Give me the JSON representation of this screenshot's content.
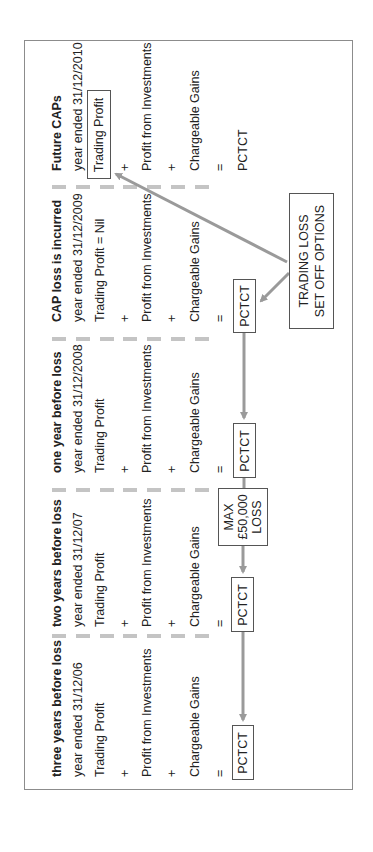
{
  "columns": [
    {
      "id": "future",
      "heading": "Future CAPs",
      "year": "year ended 31/12/2010",
      "trading": "Trading Profit",
      "plus1": "+",
      "investments": "Profit from Investments",
      "plus2": "+",
      "gains": "Chargeable Gains",
      "equals": "=",
      "result": "PCTCT"
    },
    {
      "id": "cap-loss",
      "heading": "CAP loss is incurred",
      "year": "year ended 31/12/2009",
      "trading": "Trading Profit = Nil",
      "plus1": "+",
      "investments": "Profit from Investments",
      "plus2": "+",
      "gains": "Chargeable Gains",
      "equals": "=",
      "result": "PCTCT"
    },
    {
      "id": "one-year",
      "heading": "one year before loss",
      "year": "year ended 31/12/2008",
      "trading": "Trading Profit",
      "plus1": "+",
      "investments": "Profit from Investments",
      "plus2": "+",
      "gains": "Chargeable Gains",
      "equals": "=",
      "result": "PCTCT"
    },
    {
      "id": "two-years",
      "heading": "two years before loss",
      "year": "year ended 31/12/07",
      "trading": "Trading Profit",
      "plus1": "+",
      "investments": "Profit from Investments",
      "plus2": "+",
      "gains": "Chargeable Gains",
      "equals": "=",
      "result": "PCTCT"
    },
    {
      "id": "three-years",
      "heading": "three years before loss",
      "year": "year ended 31/12/06",
      "trading": "Trading Profit",
      "plus1": "+",
      "investments": "Profit from Investments",
      "plus2": "+",
      "gains": "Chargeable Gains",
      "equals": "=",
      "result": "PCTCT"
    }
  ],
  "callouts": {
    "set_off": {
      "line1": "TRADING LOSS",
      "line2": "SET OFF OPTIONS"
    },
    "max_loss": {
      "line1": "MAX",
      "line2": "£50,000",
      "line3": "LOSS"
    }
  },
  "colors": {
    "arrow": "#9a9a9a",
    "dash": "#c4c4c4",
    "border": "#8c8c8c",
    "box_border": "#555555"
  }
}
